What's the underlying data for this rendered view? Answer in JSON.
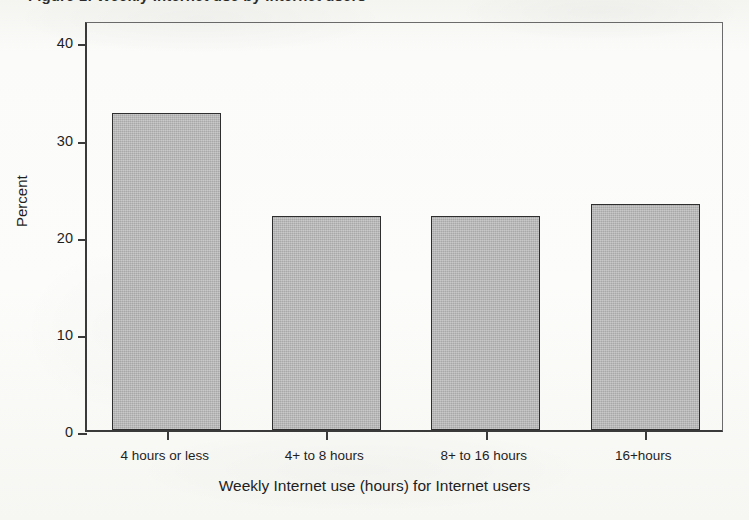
{
  "caption": {
    "text": "Figure 1: Weekly Internet use by Internet users"
  },
  "chart_data": {
    "type": "bar",
    "title": "",
    "categories": [
      "4 hours or less",
      "4+ to 8 hours",
      "8+ to 16 hours",
      "16+hours"
    ],
    "values": [
      32.6,
      22.0,
      22.0,
      23.3
    ],
    "xlabel": "Weekly Internet use (hours) for Internet users",
    "ylabel": "Percent",
    "ylim": [
      0,
      42.2
    ],
    "yticks": [
      0,
      10,
      20,
      30,
      40
    ],
    "ytick_labels": [
      "0",
      "10",
      "20",
      "30",
      "40"
    ],
    "grid": false,
    "legend": false,
    "bar_color": "#b4b4b4",
    "bar_edge_color": "#2e2e2e",
    "axis_color": "#3a3a3a",
    "background_color": "#fbfbf9"
  }
}
